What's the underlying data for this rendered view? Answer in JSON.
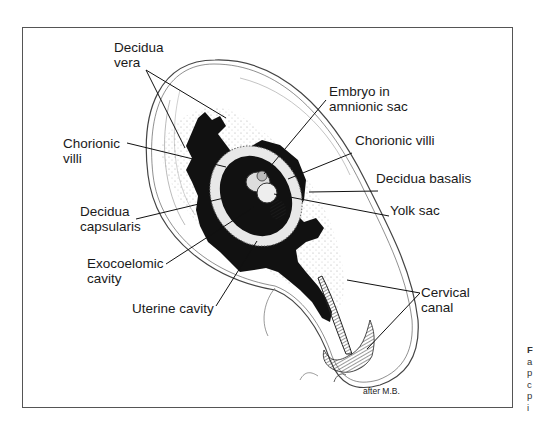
{
  "figure": {
    "labels": {
      "decidua_vera": [
        "Decidua",
        "vera"
      ],
      "chorionic_villi_left": [
        "Chorionic",
        "villi"
      ],
      "decidua_capsularis": [
        "Decidua",
        "capsularis"
      ],
      "exocoelomic_cavity": [
        "Exocoelomic",
        "cavity"
      ],
      "uterine_cavity": "Uterine cavity",
      "embryo": [
        "Embryo in",
        "amnionic sac"
      ],
      "chorionic_villi_right": "Chorionic villi",
      "decidua_basalis": "Decidua basalis",
      "yolk_sac": "Yolk sac",
      "cervical_canal": [
        "Cervical",
        "canal"
      ]
    },
    "credit": "after M.B.",
    "caption_fragment": [
      "F",
      "a",
      "p",
      "c",
      "p",
      "i"
    ]
  }
}
